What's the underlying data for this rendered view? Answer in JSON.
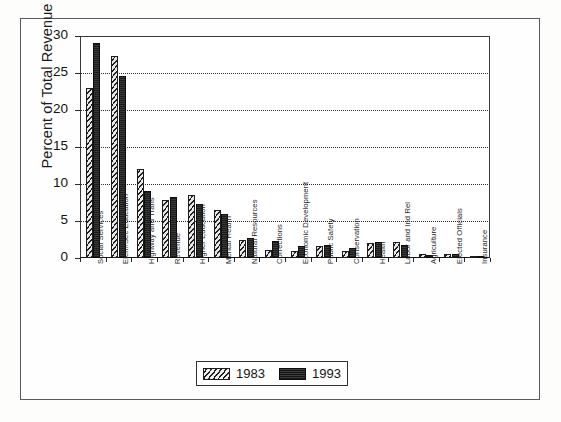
{
  "chart_data": {
    "type": "bar",
    "title": "",
    "xlabel": "",
    "ylabel": "Percent of Total Revenue",
    "ylim": [
      0,
      30
    ],
    "ytick_labels": [
      "0",
      "5",
      "10",
      "15",
      "20",
      "25",
      "30"
    ],
    "ytick_values": [
      0,
      5,
      10,
      15,
      20,
      25,
      30
    ],
    "grid": true,
    "legend_position": "bottom",
    "categories": [
      "Social Services",
      "Elem/Sec Education",
      "Highway and Trans",
      "Revenue",
      "Higher Education",
      "Mental Health",
      "Natural Resources",
      "Corrections",
      "Economic Development",
      "Public Safety",
      "Conservation",
      "Health",
      "Labor and Ind Rel",
      "Agriculture",
      "Elected Officials",
      "Insurance"
    ],
    "series": [
      {
        "name": "1983",
        "values": [
          23.0,
          27.3,
          12.0,
          7.8,
          8.5,
          6.5,
          2.5,
          1.1,
          1.0,
          1.6,
          0.9,
          2.0,
          2.1,
          0.5,
          0.5,
          0.2
        ]
      },
      {
        "name": "1993",
        "values": [
          29.0,
          24.6,
          9.1,
          8.3,
          7.3,
          6.0,
          2.7,
          2.3,
          1.6,
          1.7,
          1.3,
          2.1,
          1.8,
          0.4,
          0.6,
          0.2
        ]
      }
    ]
  },
  "legend": {
    "items": [
      {
        "label": "1983",
        "pattern": "hatched"
      },
      {
        "label": "1993",
        "pattern": "solid-dark"
      }
    ]
  }
}
